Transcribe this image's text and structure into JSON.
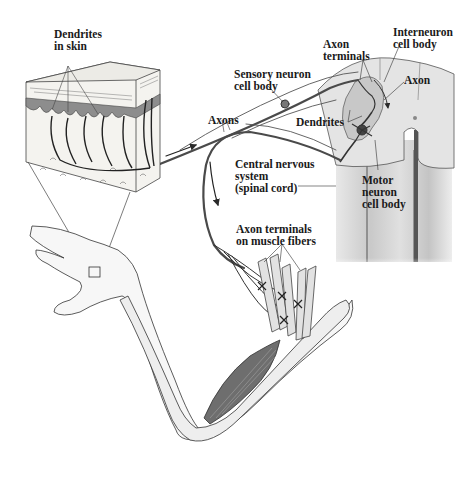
{
  "diagram": {
    "colors": {
      "background": "#ffffff",
      "line": "#2a2a2a",
      "nerve": "#4a4a4a",
      "skin_dermis": "#8a8a8a",
      "skin_block": "#f2f2ee",
      "spinal_cord": "#dcdcdc",
      "spinal_gray": "#bdbdbd",
      "muscle": "#6e6e6e",
      "arm_fill": "#f5f5f5"
    },
    "labels": {
      "dendrites_in_skin": [
        "Dendrites",
        "in skin"
      ],
      "sensory_neuron_cell_body": [
        "Sensory neuron",
        "cell body"
      ],
      "axon_terminals_top": [
        "Axon",
        "terminals"
      ],
      "interneuron_cell_body": [
        "Interneuron",
        "cell body"
      ],
      "axon": [
        "Axon"
      ],
      "axons": [
        "Axons"
      ],
      "dendrites": [
        "Dendrites"
      ],
      "cns": [
        "Central nervous",
        "system",
        "(spinal cord)"
      ],
      "motor_neuron_cell_body": [
        "Motor",
        "neuron",
        "cell body"
      ],
      "axon_terminals_muscle": [
        "Axon terminals",
        "on muscle fibers"
      ]
    }
  }
}
